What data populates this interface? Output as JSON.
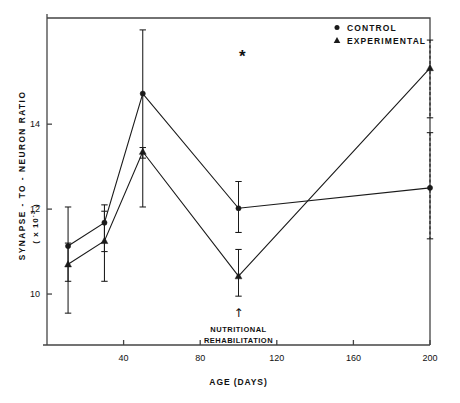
{
  "chart_data": {
    "type": "line",
    "title": "",
    "xlabel": "AGE  (DAYS)",
    "ylabel": "SYNAPSE - TO - NEURON  RATIO",
    "ylabel_units": "( x 10",
    "ylabel_exponent": "-3",
    "ylabel_units_close": " )",
    "xlim": [
      0,
      200
    ],
    "ylim": [
      8.8,
      16.5
    ],
    "xticks": [
      40,
      80,
      120,
      160,
      200
    ],
    "xtick_labels": [
      "40",
      "80",
      "120",
      "160",
      "200"
    ],
    "yticks": [
      10,
      12,
      14
    ],
    "ytick_labels": [
      "10",
      "12",
      "14"
    ],
    "grid": false,
    "legend_position": "top-right",
    "x": [
      11,
      30,
      50,
      100,
      200
    ],
    "series": [
      {
        "name": "CONTROL",
        "marker": "circle",
        "values": [
          11.13,
          11.68,
          14.72,
          12.02,
          12.5
        ],
        "err_low": [
          10.3,
          11.0,
          13.2,
          11.45,
          11.3
        ],
        "err_high": [
          12.05,
          12.1,
          16.22,
          12.65,
          13.8
        ]
      },
      {
        "name": "EXPERIMENTAL",
        "marker": "triangle",
        "values": [
          10.7,
          11.25,
          13.35,
          10.42,
          15.32
        ],
        "err_low": [
          9.55,
          10.3,
          12.05,
          9.95,
          14.15
        ],
        "err_high": [
          11.2,
          11.95,
          13.45,
          11.05,
          15.98
        ]
      }
    ],
    "annotations": [
      {
        "name": "significance-asterisk",
        "text": "*",
        "x": 102,
        "y": 15.6
      },
      {
        "name": "nutritional-rehabilitation-arrow",
        "text": "↑",
        "x": 100,
        "y": 9.55
      },
      {
        "name": "nutritional-rehabilitation-line1",
        "text": "NUTRITIONAL",
        "x": 100,
        "y": 9.2
      },
      {
        "name": "nutritional-rehabilitation-line2",
        "text": "REHABILITATION",
        "x": 100,
        "y": 8.95
      }
    ]
  },
  "legend": {
    "items": [
      {
        "label": "CONTROL",
        "marker": "circle"
      },
      {
        "label": "EXPERIMENTAL",
        "marker": "triangle"
      }
    ]
  },
  "colors": {
    "line": "#1a1a1a",
    "frame": "#444444",
    "text": "#111111",
    "background": "#ffffff"
  }
}
